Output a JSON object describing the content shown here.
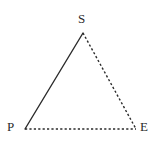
{
  "figure": {
    "name": "triangle-pse",
    "background_color": "#ffffff",
    "stroke_color": "#2b2b2b",
    "label_color": "#2b2b2b",
    "width": 156,
    "height": 151
  },
  "vertices": {
    "S": {
      "label": "S",
      "x": 83,
      "y": 33
    },
    "P": {
      "label": "P",
      "x": 25,
      "y": 129
    },
    "E": {
      "label": "E",
      "x": 136,
      "y": 129
    }
  },
  "edges": [
    {
      "name": "edge-PS",
      "from": "P",
      "to": "S",
      "style": "solid",
      "width": 1.4
    },
    {
      "name": "edge-SE",
      "from": "S",
      "to": "E",
      "style": "dashed",
      "width": 1.4,
      "dash": "2.2 2.2"
    },
    {
      "name": "edge-PE",
      "from": "P",
      "to": "E",
      "style": "dashed",
      "width": 1.4,
      "dash": "2.2 2.2"
    }
  ]
}
